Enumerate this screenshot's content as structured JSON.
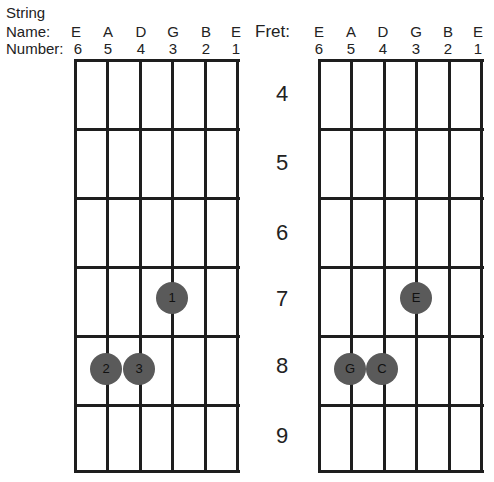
{
  "labels": {
    "string_title": "String",
    "name_label": "Name:",
    "number_label": "Number:",
    "fret_label": "Fret:"
  },
  "strings": [
    {
      "name": "E",
      "number": "6"
    },
    {
      "name": "A",
      "number": "5"
    },
    {
      "name": "D",
      "number": "4"
    },
    {
      "name": "G",
      "number": "3"
    },
    {
      "name": "B",
      "number": "2"
    },
    {
      "name": "E",
      "number": "1"
    }
  ],
  "frets": [
    "4",
    "5",
    "6",
    "7",
    "8",
    "9"
  ],
  "left_diagram": {
    "title": "Finger numbers",
    "dots": [
      {
        "string": 3,
        "fret": "7",
        "label": "1"
      },
      {
        "string": 5,
        "fret": "8",
        "label": "2"
      },
      {
        "string": 4,
        "fret": "8",
        "label": "3"
      }
    ]
  },
  "right_diagram": {
    "title": "Note names",
    "dots": [
      {
        "string": 3,
        "fret": "7",
        "label": "E"
      },
      {
        "string": 5,
        "fret": "8",
        "label": "G"
      },
      {
        "string": 4,
        "fret": "8",
        "label": "C"
      }
    ]
  },
  "colors": {
    "line": "#1e1e1e",
    "dot": "#5a5a5a"
  }
}
